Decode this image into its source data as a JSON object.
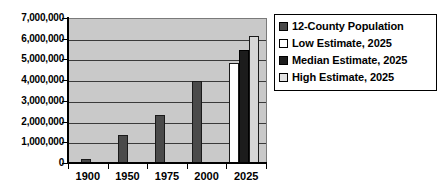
{
  "chart_data": {
    "type": "bar",
    "title": "",
    "subtitle": "",
    "xlabel": "",
    "ylabel": "",
    "categories": [
      "1900",
      "1950",
      "1975",
      "2000",
      "2025"
    ],
    "ylim": [
      0,
      7000000
    ],
    "ytick_values": [
      0,
      1000000,
      2000000,
      3000000,
      4000000,
      5000000,
      6000000,
      7000000
    ],
    "ytick_labels": [
      "0",
      "1,000,000",
      "2,000,000",
      "3,000,000",
      "4,000,000",
      "5,000,000",
      "6,000,000",
      "7,000,000"
    ],
    "grid": true,
    "grid_axis": "y",
    "legend_position": "right",
    "plot_background": "#c9c9c9",
    "series": [
      {
        "name": "12-County Population",
        "color": "#4a4a4a",
        "values": [
          250000,
          1400000,
          2350000,
          4000000,
          null
        ]
      },
      {
        "name": "Low Estimate, 2025",
        "color": "#ffffff",
        "values": [
          null,
          null,
          null,
          null,
          4900000
        ]
      },
      {
        "name": "Median Estimate, 2025",
        "color": "#1c1c1c",
        "values": [
          null,
          null,
          null,
          null,
          5500000
        ]
      },
      {
        "name": "High Estimate, 2025",
        "color": "#e2e2e2",
        "values": [
          null,
          null,
          null,
          null,
          6200000
        ]
      }
    ],
    "bars": [
      {
        "name": "bar-1900-population",
        "series": "12-County Population",
        "category": "1900",
        "value": 250000,
        "style": "hist",
        "left_pct": 6.6,
        "width_pct": 5.1
      },
      {
        "name": "bar-1950-population",
        "series": "12-County Population",
        "category": "1950",
        "value": 1400000,
        "style": "hist",
        "left_pct": 25.3,
        "width_pct": 5.1
      },
      {
        "name": "bar-1975-population",
        "series": "12-County Population",
        "category": "1975",
        "value": 2350000,
        "style": "hist",
        "left_pct": 44.0,
        "width_pct": 5.1
      },
      {
        "name": "bar-2000-population",
        "series": "12-County Population",
        "category": "2000",
        "value": 4000000,
        "style": "hist",
        "left_pct": 62.7,
        "width_pct": 5.1
      },
      {
        "name": "bar-2025-low-estimate",
        "series": "Low Estimate, 2025",
        "category": "2025",
        "value": 4900000,
        "style": "low",
        "left_pct": 81.4,
        "width_pct": 5.1
      },
      {
        "name": "bar-2025-median-estimate",
        "series": "Median Estimate, 2025",
        "category": "2025",
        "value": 5500000,
        "style": "median",
        "left_pct": 86.5,
        "width_pct": 5.1
      },
      {
        "name": "bar-2025-high-estimate",
        "series": "High Estimate, 2025",
        "category": "2025",
        "value": 6200000,
        "style": "high",
        "left_pct": 91.6,
        "width_pct": 5.1
      }
    ]
  },
  "legend": {
    "items": [
      {
        "label": "12-County Population",
        "swatch": "sw-hist",
        "icon": "legend-swatch-icon"
      },
      {
        "label": "Low Estimate, 2025",
        "swatch": "sw-low",
        "icon": "legend-swatch-icon"
      },
      {
        "label": "Median Estimate, 2025",
        "swatch": "sw-median",
        "icon": "legend-swatch-icon"
      },
      {
        "label": "High Estimate, 2025",
        "swatch": "sw-high",
        "icon": "legend-swatch-icon"
      }
    ]
  }
}
